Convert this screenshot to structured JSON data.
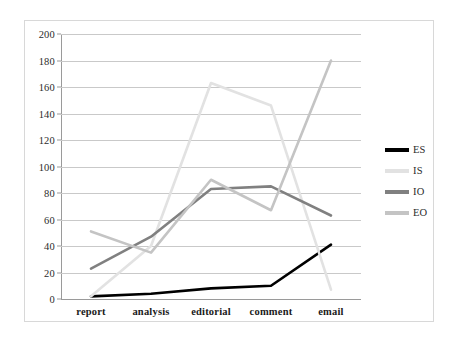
{
  "chart_data": {
    "type": "line",
    "title": "",
    "xlabel": "",
    "ylabel": "",
    "categories": [
      "report",
      "analysis",
      "editorial",
      "comment",
      "email"
    ],
    "ylim": [
      0,
      200
    ],
    "yticks": [
      0,
      20,
      40,
      60,
      80,
      100,
      120,
      140,
      160,
      180,
      200
    ],
    "grid": true,
    "legend_position": "right",
    "series": [
      {
        "name": "ES",
        "color": "#000000",
        "values": [
          2,
          4,
          8,
          10,
          41
        ]
      },
      {
        "name": "IS",
        "color": "#e2e2e2",
        "values": [
          2,
          40,
          163,
          146,
          7
        ]
      },
      {
        "name": "IO",
        "color": "#808080",
        "values": [
          23,
          47,
          83,
          85,
          63
        ]
      },
      {
        "name": "EO",
        "color": "#c4c4c4",
        "values": [
          51,
          35,
          90,
          67,
          180
        ]
      }
    ]
  },
  "axis": {
    "y_tick_labels": [
      "200",
      "180",
      "160",
      "140",
      "120",
      "100",
      "80",
      "60",
      "40",
      "20",
      "0"
    ]
  },
  "legend": {
    "items": [
      {
        "label": "ES"
      },
      {
        "label": "IS"
      },
      {
        "label": "IO"
      },
      {
        "label": "EO"
      }
    ]
  },
  "colors": {
    "frame_border": "#d8d8d8",
    "gridline": "#c9c9c9",
    "axis": "#9a9a9a",
    "text": "#2b2b2b"
  }
}
